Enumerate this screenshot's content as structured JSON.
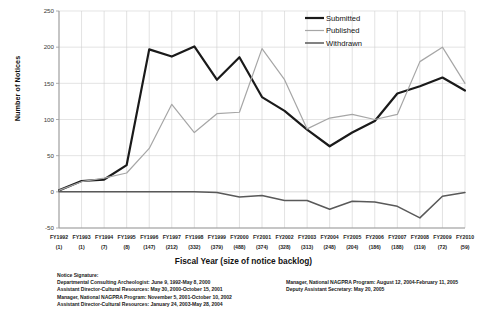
{
  "chart_data": {
    "type": "line",
    "title": "",
    "xlabel": "Fiscal Year (size of notice backlog)",
    "ylabel": "Number of Notices",
    "ylim": [
      -50,
      250
    ],
    "yticks": [
      250,
      200,
      150,
      100,
      50,
      0,
      -50
    ],
    "grid": true,
    "legend_position": "top-right",
    "categories": [
      "FY1992",
      "FY1993",
      "FY1994",
      "FY1995",
      "FY1996",
      "FY1997",
      "FY1998",
      "FY1999",
      "FY2000",
      "FY2001",
      "FY2002",
      "FY2003",
      "FY2004",
      "FY2005",
      "FY2006",
      "FY2007",
      "FY2008",
      "FY2009",
      "FY2010"
    ],
    "category_sublabels": [
      "(1)",
      "(1)",
      "(7)",
      "(8)",
      "(147)",
      "(212)",
      "(332)",
      "(379)",
      "(488)",
      "(374)",
      "(328)",
      "(313)",
      "(248)",
      "(204)",
      "(186)",
      "(188)",
      "(119)",
      "(72)",
      "(59)"
    ],
    "series": [
      {
        "name": "Submitted",
        "color": "#1a1a1a",
        "width": 2.2,
        "values": [
          2,
          15,
          17,
          37,
          197,
          187,
          201,
          155,
          186,
          131,
          112,
          86,
          63,
          82,
          98,
          136,
          146,
          158,
          140
        ]
      },
      {
        "name": "Published",
        "color": "#a6a6a6",
        "width": 1.2,
        "values": [
          2,
          14,
          19,
          26,
          60,
          121,
          82,
          108,
          110,
          198,
          155,
          87,
          102,
          107,
          100,
          107,
          180,
          200,
          150
        ]
      },
      {
        "name": "Withdrawn",
        "color": "#595959",
        "width": 1.5,
        "values": [
          0,
          0,
          0,
          0,
          0,
          0,
          0,
          -1,
          -7,
          -5,
          -12,
          -12,
          -24,
          -13,
          -14,
          -20,
          -36,
          -6,
          -1
        ]
      }
    ]
  },
  "legend": {
    "items": [
      {
        "label": "Submitted"
      },
      {
        "label": "Published"
      },
      {
        "label": "Withdrawn"
      }
    ]
  },
  "footnotes": {
    "title": "Notice Signature:",
    "left_lines": [
      "Departmental Consulting Archeologist: June 9, 1992-May 8, 2000",
      "Assistant Director-Cultural Resources: May 30, 2000-October 15, 2001",
      "Manager, National NAGPRA Program: November 5, 2001-October 10, 2002",
      "Assistant Director-Cultural Resources: January 24, 2003-May 28, 2004"
    ],
    "right_lines": [
      "Manager, National NAGPRA Program: August 12, 2004-February 11, 2005",
      "Deputy Assistant Secretary: May 20, 2005"
    ]
  }
}
